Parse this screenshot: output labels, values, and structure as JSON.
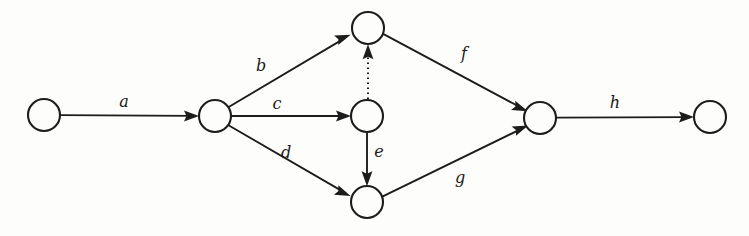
{
  "diagram": {
    "type": "directed-graph",
    "title": "",
    "background_color": "#fdfdfb",
    "stroke_color": "#1c1c1c",
    "canvas": {
      "width": 749,
      "height": 236
    },
    "node_radius": 16,
    "nodes": [
      {
        "id": "n1",
        "name": "source-node",
        "label": "",
        "cx": 44,
        "cy": 115
      },
      {
        "id": "n2",
        "name": "branch-node",
        "label": "",
        "cx": 215,
        "cy": 116
      },
      {
        "id": "n3",
        "name": "upper-node",
        "label": "",
        "cx": 368,
        "cy": 28
      },
      {
        "id": "n4",
        "name": "middle-node",
        "label": "",
        "cx": 367,
        "cy": 116
      },
      {
        "id": "n5",
        "name": "lower-node",
        "label": "",
        "cx": 367,
        "cy": 202
      },
      {
        "id": "n6",
        "name": "merge-node",
        "label": "",
        "cx": 540,
        "cy": 118
      },
      {
        "id": "n7",
        "name": "sink-node",
        "label": "",
        "cx": 710,
        "cy": 117
      }
    ],
    "edges": [
      {
        "id": "e-a",
        "label": "a",
        "from": "n1",
        "to": "n2",
        "style": "solid",
        "label_x": 124,
        "label_y": 102
      },
      {
        "id": "e-b",
        "label": "b",
        "from": "n2",
        "to": "n3",
        "style": "solid",
        "label_x": 261,
        "label_y": 66
      },
      {
        "id": "e-c",
        "label": "c",
        "from": "n2",
        "to": "n4",
        "style": "solid",
        "label_x": 277,
        "label_y": 104
      },
      {
        "id": "e-d",
        "label": "d",
        "from": "n2",
        "to": "n5",
        "style": "solid",
        "label_x": 286,
        "label_y": 153
      },
      {
        "id": "e-e",
        "label": "e",
        "from": "n4",
        "to": "n5",
        "style": "solid",
        "label_x": 379,
        "label_y": 152
      },
      {
        "id": "e-f",
        "label": "f",
        "from": "n3",
        "to": "n6",
        "style": "solid",
        "label_x": 464,
        "label_y": 54
      },
      {
        "id": "e-g",
        "label": "g",
        "from": "n5",
        "to": "n6",
        "style": "solid",
        "label_x": 460,
        "label_y": 178
      },
      {
        "id": "e-h",
        "label": "h",
        "from": "n6",
        "to": "n7",
        "style": "solid",
        "label_x": 615,
        "label_y": 103
      },
      {
        "id": "e-dotted",
        "label": "",
        "from": "n4",
        "to": "n3",
        "style": "dotted",
        "label_x": 0,
        "label_y": 0
      }
    ]
  }
}
